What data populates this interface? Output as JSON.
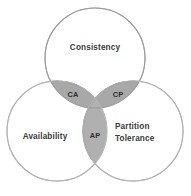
{
  "diagram": {
    "background_color": "#ffffff",
    "stroke_color": "#b5b5b5",
    "stroke_width": 1.1,
    "circle_fill": "#ffffff",
    "lens_fill_pair": "#a8a8a8",
    "lens_fill_ap": "#b0b0b0",
    "lens_stroke": "#8e8e8e",
    "label_color": "#3a3a3a",
    "circles": [
      {
        "id": "consistency",
        "label": "Consistency",
        "cx": 95,
        "cy": 58,
        "r": 50,
        "label_x": 95,
        "label_y": 48
      },
      {
        "id": "availability",
        "label": "Availability",
        "cx": 57,
        "cy": 131,
        "r": 50,
        "label_x": 45,
        "label_y": 137
      },
      {
        "id": "partition-tolerance",
        "label_line1": "Partition",
        "label_line2": "Tolerance",
        "cx": 133,
        "cy": 131,
        "r": 50,
        "label_x": 115,
        "label_y": 132
      }
    ],
    "intersections": [
      {
        "id": "ca",
        "label": "CA",
        "label_x": 73,
        "label_y": 95,
        "description": "Consistency and Availability"
      },
      {
        "id": "cp",
        "label": "CP",
        "label_x": 118,
        "label_y": 95,
        "description": "Consistency and Partition Tolerance"
      },
      {
        "id": "ap",
        "label": "AP",
        "label_x": 95,
        "label_y": 136,
        "description": "Availability and Partition Tolerance"
      }
    ]
  }
}
